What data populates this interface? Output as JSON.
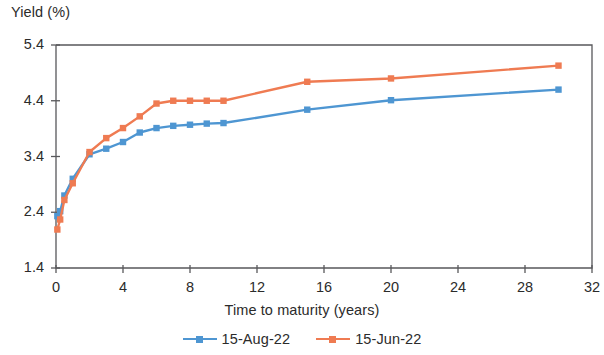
{
  "chart_data": {
    "type": "line",
    "title": "",
    "ylabel": "Yield (%)",
    "xlabel": "Time to maturity (years)",
    "xlim": [
      0,
      32
    ],
    "ylim": [
      1.4,
      5.4
    ],
    "xticks": [
      0,
      4,
      8,
      12,
      16,
      20,
      24,
      28,
      32
    ],
    "xtick_labels": [
      "0",
      "4",
      "8",
      "12",
      "16",
      "20",
      "24",
      "28",
      "32"
    ],
    "yticks": [
      1.4,
      2.4,
      3.4,
      4.4,
      5.4
    ],
    "ytick_labels": [
      "1.4",
      "2.4",
      "3.4",
      "4.4",
      "5.4"
    ],
    "grid": false,
    "legend_position": "bottom",
    "series": [
      {
        "name": "15-Aug-22",
        "color": "#4e96d2",
        "marker": "square",
        "x": [
          0.08,
          0.25,
          0.5,
          1,
          2,
          3,
          4,
          5,
          6,
          7,
          8,
          9,
          10,
          15,
          20,
          30
        ],
        "y": [
          2.33,
          2.42,
          2.7,
          3.0,
          3.44,
          3.54,
          3.66,
          3.83,
          3.91,
          3.95,
          3.97,
          3.99,
          4.0,
          4.24,
          4.41,
          4.6
        ]
      },
      {
        "name": "15-Jun-22",
        "color": "#ef7b52",
        "marker": "square",
        "x": [
          0.08,
          0.25,
          0.5,
          1,
          2,
          3,
          4,
          5,
          6,
          7,
          8,
          9,
          10,
          15,
          20,
          30
        ],
        "y": [
          2.09,
          2.27,
          2.62,
          2.92,
          3.48,
          3.73,
          3.91,
          4.12,
          4.35,
          4.4,
          4.4,
          4.4,
          4.4,
          4.74,
          4.8,
          5.03
        ]
      }
    ]
  },
  "legend": {
    "items": [
      {
        "label": "15-Aug-22",
        "color": "#4e96d2"
      },
      {
        "label": "15-Jun-22",
        "color": "#ef7b52"
      }
    ]
  }
}
